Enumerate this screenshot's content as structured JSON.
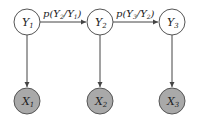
{
  "diagram": {
    "type": "hidden-markov-model",
    "hidden_nodes": [
      {
        "id": "Y1",
        "base": "Y",
        "sub": "1",
        "cx": 27,
        "cy": 22
      },
      {
        "id": "Y2",
        "base": "Y",
        "sub": "2",
        "cx": 100,
        "cy": 22
      },
      {
        "id": "Y3",
        "base": "Y",
        "sub": "3",
        "cx": 172,
        "cy": 22
      }
    ],
    "observed_nodes": [
      {
        "id": "X1",
        "base": "X",
        "sub": "1",
        "cx": 27,
        "cy": 101
      },
      {
        "id": "X2",
        "base": "X",
        "sub": "2",
        "cx": 100,
        "cy": 101
      },
      {
        "id": "X3",
        "base": "X",
        "sub": "3",
        "cx": 172,
        "cy": 101
      }
    ],
    "transition_edges": [
      {
        "from": "Y1",
        "to": "Y2",
        "label": {
          "p": "p(",
          "a": "Y",
          "asub": "2",
          "slash": "/",
          "b": "Y",
          "bsub": "1",
          "close": ")"
        }
      },
      {
        "from": "Y2",
        "to": "Y3",
        "label": {
          "p": "p(",
          "a": "Y",
          "asub": "3",
          "slash": "/",
          "b": "Y",
          "bsub": "2",
          "close": ")"
        }
      }
    ],
    "emission_edges": [
      {
        "from": "Y1",
        "to": "X1"
      },
      {
        "from": "Y2",
        "to": "X2"
      },
      {
        "from": "Y3",
        "to": "X3"
      }
    ],
    "colors": {
      "hidden_fill": "#ffffff",
      "observed_fill": "#a9a9a9",
      "stroke": "#555555"
    }
  }
}
